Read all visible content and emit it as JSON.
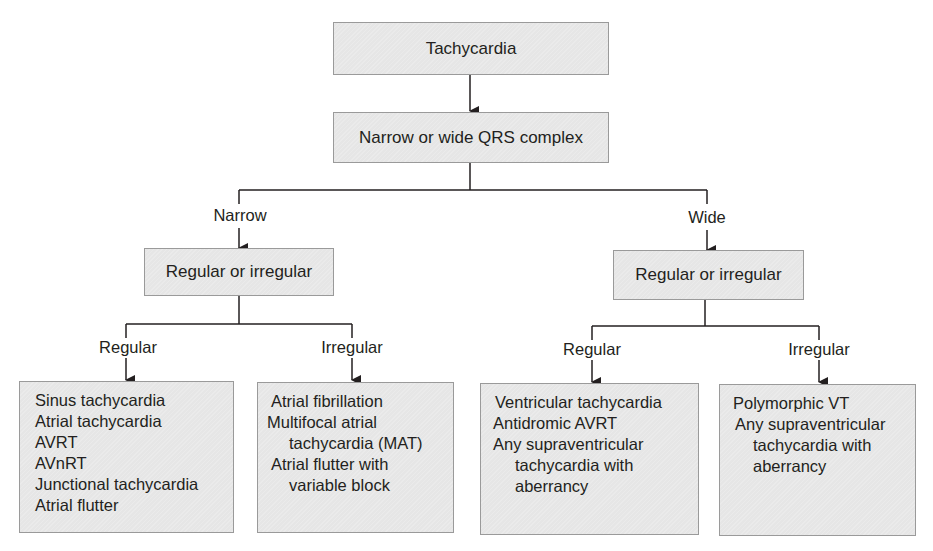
{
  "root": {
    "label": "Tachycardia"
  },
  "qrs": {
    "label": "Narrow or wide QRS complex"
  },
  "narrow": {
    "branch_label": "Narrow",
    "decision": "Regular or irregular",
    "regular": {
      "branch_label": "Regular",
      "items": [
        "Sinus tachycardia",
        "Atrial tachycardia",
        "AVRT",
        "AVnRT",
        "Junctional tachycardia",
        "Atrial flutter"
      ]
    },
    "irregular": {
      "branch_label": "Irregular",
      "items": [
        "Atrial fibrillation",
        "Multifocal atrial",
        "tachycardia (MAT)",
        "Atrial flutter with",
        "variable block"
      ]
    }
  },
  "wide": {
    "branch_label": "Wide",
    "decision": "Regular or irregular",
    "regular": {
      "branch_label": "Regular",
      "items": [
        "Ventricular tachycardia",
        "Antidromic AVRT",
        "Any supraventricular",
        "tachycardia with",
        "aberrancy"
      ]
    },
    "irregular": {
      "branch_label": "Irregular",
      "items": [
        "Polymorphic VT",
        "Any supraventricular",
        "tachycardia with",
        "aberrancy"
      ]
    }
  },
  "colors": {
    "box_fill": "#e6e6e6",
    "box_border": "#9a9a9a",
    "line": "#231f20"
  }
}
